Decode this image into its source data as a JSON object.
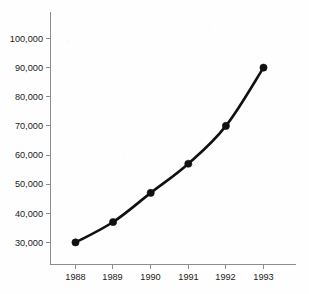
{
  "chart_data": {
    "type": "line",
    "title": "",
    "subtitle": "",
    "xlabel": "",
    "ylabel": "",
    "categories": [
      "1988",
      "1989",
      "1990",
      "1991",
      "1992",
      "1993"
    ],
    "x": [
      1988,
      1989,
      1990,
      1991,
      1992,
      1993
    ],
    "values": [
      30000,
      37000,
      47000,
      57000,
      70000,
      90000
    ],
    "series": [
      {
        "name": "",
        "values": [
          30000,
          37000,
          47000,
          57000,
          70000,
          90000
        ]
      }
    ],
    "ylim": [
      26000,
      106000
    ],
    "xlim": [
      1987.6,
      1993.9
    ],
    "y_ticks": [
      30000,
      40000,
      50000,
      60000,
      70000,
      80000,
      90000,
      100000
    ],
    "y_tick_labels": [
      "30,000",
      "40,000",
      "50,000",
      "60,000",
      "70,000",
      "80,000",
      "90,000",
      "100,000"
    ],
    "x_ticks": [
      1988,
      1989,
      1990,
      1991,
      1992,
      1993
    ],
    "x_tick_labels": [
      "1988",
      "1989",
      "1990",
      "1991",
      "1992",
      "1993"
    ],
    "grid": false,
    "legend": false,
    "legend_position": "none",
    "marker": "circle",
    "colors": {
      "series_line": "#111111",
      "marker": "#111111",
      "axis": "#8c8c8c",
      "tick_label": "#1b1b1b",
      "background": "#fefefe"
    },
    "annotations": []
  }
}
